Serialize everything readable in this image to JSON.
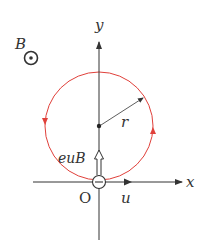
{
  "diagram": {
    "type": "charged particle circular motion in magnetic field",
    "labels": {
      "field": "B",
      "y_axis": "y",
      "x_axis": "x",
      "origin": "O",
      "radius": "r",
      "force": "euB",
      "velocity": "u",
      "charge_sign": "−"
    },
    "colors": {
      "orbit": "#e0403a",
      "axes": "#333333",
      "text": "#333333"
    },
    "field_direction": "out of page",
    "orbit_direction": "counterclockwise"
  }
}
